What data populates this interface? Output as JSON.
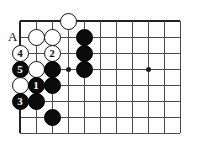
{
  "diagram": {
    "type": "go-board-problem",
    "board": {
      "origin_x": 20,
      "origin_y": 21,
      "spacing": 16,
      "cols": 11,
      "rows": 8,
      "top_edge": true,
      "left_edge": true,
      "star_points": [
        {
          "col": 3,
          "row": 3
        },
        {
          "col": 8,
          "row": 3
        }
      ]
    },
    "labels": [
      {
        "text": "A",
        "col": 0,
        "row": 1,
        "offset_x": -8,
        "offset_y": 0
      }
    ],
    "stones": [
      {
        "color": "white",
        "col": 3,
        "row": 0,
        "number": ""
      },
      {
        "color": "white",
        "col": 1,
        "row": 1,
        "number": ""
      },
      {
        "color": "white",
        "col": 2,
        "row": 1,
        "number": ""
      },
      {
        "color": "black",
        "col": 4,
        "row": 1,
        "number": ""
      },
      {
        "color": "white",
        "col": 0,
        "row": 2,
        "number": "4"
      },
      {
        "color": "white",
        "col": 2,
        "row": 2,
        "number": "2"
      },
      {
        "color": "black",
        "col": 4,
        "row": 2,
        "number": ""
      },
      {
        "color": "black",
        "col": 0,
        "row": 3,
        "number": "5"
      },
      {
        "color": "white",
        "col": 1,
        "row": 3,
        "number": ""
      },
      {
        "color": "black",
        "col": 2,
        "row": 3,
        "number": ""
      },
      {
        "color": "black",
        "col": 4,
        "row": 3,
        "number": ""
      },
      {
        "color": "white",
        "col": 0,
        "row": 4,
        "number": ""
      },
      {
        "color": "black",
        "col": 1,
        "row": 4,
        "number": "1"
      },
      {
        "color": "black",
        "col": 2,
        "row": 4,
        "number": ""
      },
      {
        "color": "black",
        "col": 0,
        "row": 5,
        "number": "3"
      },
      {
        "color": "black",
        "col": 1,
        "row": 5,
        "number": ""
      },
      {
        "color": "black",
        "col": 2,
        "row": 6,
        "number": ""
      }
    ],
    "move_numbers": [
      "1",
      "2",
      "3",
      "4",
      "5"
    ],
    "colors": {
      "black_stone": "#0b0b0b",
      "white_stone": "#ffffff",
      "grid_line": "#4a4a4a",
      "edge_line": "#222222",
      "board_background": "#fefefe"
    }
  }
}
